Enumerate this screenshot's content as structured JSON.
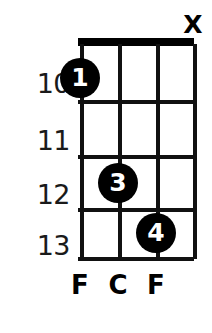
{
  "diagram": {
    "type": "chord-diagram",
    "instrument_strings": 4,
    "first_fret": 10,
    "colors": {
      "ink": "#000000",
      "background": "#ffffff",
      "grid": "#111111",
      "dot_text": "#ffffff"
    },
    "nut": {
      "style": "thick-bar",
      "is_nut": true
    },
    "frets": [
      {
        "number": "10",
        "y": 70
      },
      {
        "number": "11",
        "y": 127
      },
      {
        "number": "12",
        "y": 181
      },
      {
        "number": "13",
        "y": 232
      }
    ],
    "fret_lines_y": [
      38,
      100,
      155,
      208,
      257
    ],
    "strings": [
      {
        "index": 1,
        "x": 80,
        "note": "F",
        "status": "fretted"
      },
      {
        "index": 2,
        "x": 118,
        "note": "C",
        "status": "fretted"
      },
      {
        "index": 3,
        "x": 156,
        "note": "F",
        "status": "fretted"
      },
      {
        "index": 4,
        "x": 193,
        "note": "",
        "status": "muted"
      }
    ],
    "dots": [
      {
        "finger": "1",
        "string": 1,
        "fret": "10",
        "x": 80,
        "y": 78
      },
      {
        "finger": "3",
        "string": 2,
        "fret": "12",
        "x": 118,
        "y": 183
      },
      {
        "finger": "4",
        "string": 3,
        "fret": "13",
        "x": 156,
        "y": 233
      }
    ],
    "markers": [
      {
        "symbol": "X",
        "meaning": "muted-string",
        "string": 4,
        "x": 193,
        "y": 12
      }
    ],
    "note_labels": [
      {
        "text": "F",
        "x": 80
      },
      {
        "text": "C",
        "x": 118
      },
      {
        "text": "F",
        "x": 156
      }
    ],
    "note_labels_y": 272
  }
}
